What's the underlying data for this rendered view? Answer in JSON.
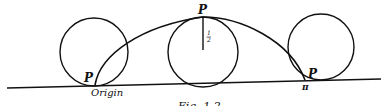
{
  "figure": {
    "type": "cycloid-diagram",
    "caption": "Fig. 1.2",
    "labels": {
      "point_start": "P",
      "origin": "Origin",
      "point_top": "P",
      "radius": "1/2",
      "radius_num": "1",
      "radius_den": "2",
      "point_end": "P",
      "end_value": "π"
    },
    "colors": {
      "stroke": "#111111",
      "background": "#ffffff"
    }
  }
}
